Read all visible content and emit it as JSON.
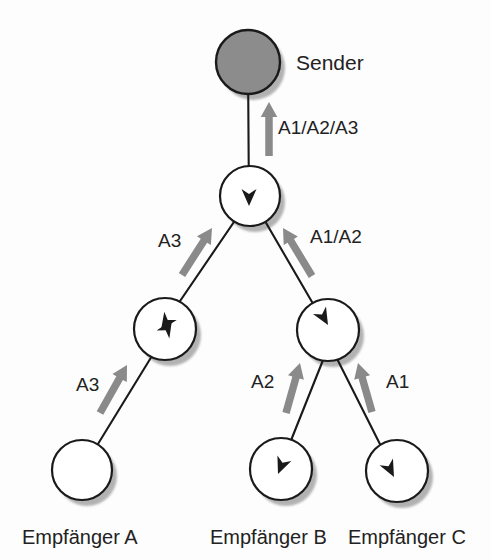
{
  "diagram": {
    "title": "Sender",
    "type": "multicast-distribution-tree",
    "colors": {
      "sender_fill": "#8c8c8c",
      "node_fill": "#ffffff",
      "node_stroke": "#1a1a1a",
      "shadow": "#9a9a9a",
      "link": "#1a1a1a",
      "flow_arrow": "#8a8a8a",
      "text": "#222222",
      "background": "#fdfdfd"
    },
    "nodes": [
      {
        "id": "sender",
        "label": "Sender",
        "cx": 248,
        "cy": 62,
        "r": 32,
        "kind": "sender"
      },
      {
        "id": "router1",
        "label": "",
        "cx": 250,
        "cy": 196,
        "r": 30,
        "kind": "router"
      },
      {
        "id": "router2",
        "label": "",
        "cx": 165,
        "cy": 329,
        "r": 31,
        "kind": "router"
      },
      {
        "id": "router3",
        "label": "",
        "cx": 328,
        "cy": 330,
        "r": 31,
        "kind": "router"
      },
      {
        "id": "recvA",
        "label": "Empfänger A",
        "cx": 82,
        "cy": 470,
        "r": 30,
        "kind": "receiver"
      },
      {
        "id": "recvB",
        "label": "Empfänger B",
        "cx": 281,
        "cy": 469,
        "r": 31,
        "kind": "receiver"
      },
      {
        "id": "recvC",
        "label": "Empfänger C",
        "cx": 397,
        "cy": 471,
        "r": 31,
        "kind": "receiver"
      }
    ],
    "receiver_labels": [
      {
        "text": "Empfänger A",
        "x": 22,
        "y": 527
      },
      {
        "text": "Empfänger B",
        "x": 210,
        "y": 527
      },
      {
        "text": "Empfänger C",
        "x": 348,
        "y": 527
      }
    ],
    "sender_label": {
      "text": "Sender",
      "x": 296,
      "y": 52
    },
    "links": [
      {
        "id": "sender-router1",
        "from": "sender",
        "to": "router1",
        "x1": 248,
        "y1": 62,
        "x2": 249,
        "y2": 208
      },
      {
        "id": "router1-router2",
        "from": "router1",
        "to": "router2",
        "x1": 251,
        "y1": 197,
        "x2": 148,
        "y2": 348
      },
      {
        "id": "router1-router3",
        "from": "router1",
        "to": "router3",
        "x1": 251,
        "y1": 197,
        "x2": 337,
        "y2": 345
      },
      {
        "id": "router2-recvA",
        "from": "recvA",
        "to": "router2",
        "x1": 82,
        "y1": 470,
        "x2": 182,
        "y2": 307
      },
      {
        "id": "router3-recvB",
        "from": "router3",
        "to": "recvB",
        "x1": 345,
        "y1": 305,
        "x2": 276,
        "y2": 478
      },
      {
        "id": "router3-recvC",
        "from": "router3",
        "to": "recvC",
        "x1": 310,
        "y1": 305,
        "x2": 399,
        "y2": 482
      }
    ],
    "flows": [
      {
        "id": "flow-trunk",
        "label": "A1/A2/A3",
        "label_x": 278,
        "label_y": 118,
        "arrow": {
          "x1": 269,
          "y1": 156,
          "x2": 269,
          "y2": 102
        }
      },
      {
        "id": "flow-left-upper",
        "label": "A3",
        "label_x": 158,
        "label_y": 231,
        "arrow": {
          "x1": 182,
          "y1": 275,
          "x2": 212,
          "y2": 228
        }
      },
      {
        "id": "flow-right-upper",
        "label": "A1/A2",
        "label_x": 310,
        "label_y": 227,
        "arrow": {
          "x1": 312,
          "y1": 276,
          "x2": 283,
          "y2": 228
        }
      },
      {
        "id": "flow-left-lower",
        "label": "A3",
        "label_x": 76,
        "label_y": 375,
        "arrow": {
          "x1": 100,
          "y1": 413,
          "x2": 127,
          "y2": 365
        }
      },
      {
        "id": "flow-recvB",
        "label": "A2",
        "label_x": 251,
        "label_y": 372,
        "arrow": {
          "x1": 286,
          "y1": 413,
          "x2": 300,
          "y2": 363
        }
      },
      {
        "id": "flow-recvC",
        "label": "A1",
        "label_x": 386,
        "label_y": 372,
        "arrow": {
          "x1": 372,
          "y1": 412,
          "x2": 358,
          "y2": 363
        }
      }
    ],
    "inline_arrowheads": [
      {
        "id": "head-router1",
        "x": 249,
        "y": 206,
        "angle": 90
      },
      {
        "id": "head-router2-in",
        "x": 161,
        "y": 330,
        "angle": 124
      },
      {
        "id": "head-router2-up",
        "x": 172,
        "y": 320,
        "angle": -58
      },
      {
        "id": "head-router3-in",
        "x": 328,
        "y": 325,
        "angle": 60
      },
      {
        "id": "head-recvB",
        "x": 278,
        "y": 474,
        "angle": 112
      },
      {
        "id": "head-recvC",
        "x": 394,
        "y": 477,
        "angle": 63
      }
    ]
  }
}
